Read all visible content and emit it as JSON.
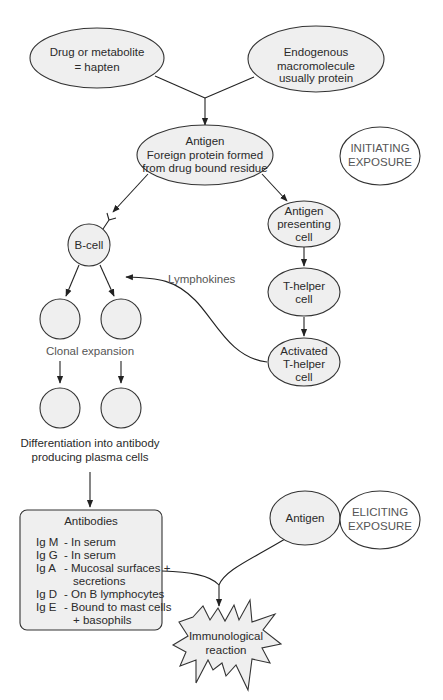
{
  "colors": {
    "node_fill": "#efefef",
    "stroke": "#333333",
    "text": "#2a2a2a",
    "label_text": "#555555",
    "background": "#ffffff"
  },
  "nodes": {
    "hapten": {
      "lines": [
        "Drug or metabolite",
        "= hapten"
      ]
    },
    "macromolecule": {
      "lines": [
        "Endogenous",
        "macromolecule",
        "usually protein"
      ]
    },
    "antigen_main": {
      "lines": [
        "Antigen",
        "Foreign protein formed",
        "from drug bound residue"
      ]
    },
    "initiating": {
      "lines": [
        "INITIATING",
        "EXPOSURE"
      ]
    },
    "b_cell": {
      "label": "B-cell"
    },
    "apc": {
      "lines": [
        "Antigen",
        "presenting",
        "cell"
      ]
    },
    "t_helper": {
      "lines": [
        "T-helper",
        "cell"
      ]
    },
    "activated_t_helper": {
      "lines": [
        "Activated",
        "T-helper",
        "cell"
      ]
    },
    "clonal_expansion": {
      "label": "Clonal expansion"
    },
    "differentiation": {
      "lines": [
        "Differentiation into antibody",
        "producing plasma cells"
      ]
    },
    "antibodies": {
      "title": "Antibodies",
      "rows": [
        {
          "code": "Ig M",
          "desc": [
            "- In serum"
          ]
        },
        {
          "code": "Ig G",
          "desc": [
            "- In serum"
          ]
        },
        {
          "code": "Ig A",
          "desc": [
            "- Mucosal surfaces +",
            "secretions"
          ]
        },
        {
          "code": "Ig D",
          "desc": [
            "- On B lymphocytes"
          ]
        },
        {
          "code": "Ig E",
          "desc": [
            "- Bound to mast cells",
            "+ basophils"
          ]
        }
      ]
    },
    "antigen_second": {
      "label": "Antigen"
    },
    "eliciting": {
      "lines": [
        "ELICITING",
        "EXPOSURE"
      ]
    },
    "reaction": {
      "lines": [
        "Immunological",
        "reaction"
      ]
    }
  },
  "edges": {
    "lymphokines_label": "Lymphokines"
  }
}
